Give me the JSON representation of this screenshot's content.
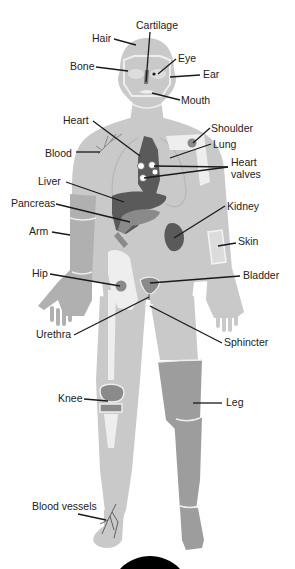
{
  "diagram": {
    "type": "anatomy-labeled-figure",
    "colors": {
      "body_light": "#c9c9c9",
      "body_mid": "#b0b0b0",
      "organ_dark": "#5a5a5a",
      "organ_mid": "#8a8a8a",
      "bone": "#eeeeee",
      "leg_dark": "#9d9d9d",
      "label_text": "#222222",
      "leader_line": "#1a1a1a",
      "bottom_shape": "#000000"
    },
    "labels": [
      {
        "id": "cartilage",
        "text": "Cartilage",
        "x": 136,
        "y": 29
      },
      {
        "id": "hair",
        "text": "Hair",
        "x": 92,
        "y": 42
      },
      {
        "id": "eye",
        "text": "Eye",
        "x": 178,
        "y": 62
      },
      {
        "id": "bone",
        "text": "Bone",
        "x": 70,
        "y": 70
      },
      {
        "id": "ear",
        "text": "Ear",
        "x": 203,
        "y": 78
      },
      {
        "id": "mouth",
        "text": "Mouth",
        "x": 181,
        "y": 104
      },
      {
        "id": "heart",
        "text": "Heart",
        "x": 63,
        "y": 124
      },
      {
        "id": "shoulder",
        "text": "Shoulder",
        "x": 211,
        "y": 132
      },
      {
        "id": "lung",
        "text": "Lung",
        "x": 213,
        "y": 148
      },
      {
        "id": "blood",
        "text": "Blood",
        "x": 45,
        "y": 157
      },
      {
        "id": "heart-valves-1",
        "text": "Heart",
        "x": 231,
        "y": 166
      },
      {
        "id": "heart-valves-2",
        "text": "valves",
        "x": 231,
        "y": 178
      },
      {
        "id": "liver",
        "text": "Liver",
        "x": 38,
        "y": 185
      },
      {
        "id": "pancreas",
        "text": "Pancreas",
        "x": 11,
        "y": 207
      },
      {
        "id": "kidney",
        "text": "Kidney",
        "x": 227,
        "y": 210
      },
      {
        "id": "arm",
        "text": "Arm",
        "x": 29,
        "y": 235
      },
      {
        "id": "skin",
        "text": "Skin",
        "x": 238,
        "y": 245
      },
      {
        "id": "hip",
        "text": "Hip",
        "x": 32,
        "y": 277
      },
      {
        "id": "bladder",
        "text": "Bladder",
        "x": 243,
        "y": 279
      },
      {
        "id": "urethra",
        "text": "Urethra",
        "x": 36,
        "y": 338
      },
      {
        "id": "sphincter",
        "text": "Sphincter",
        "x": 224,
        "y": 346
      },
      {
        "id": "knee",
        "text": "Knee",
        "x": 58,
        "y": 402
      },
      {
        "id": "leg",
        "text": "Leg",
        "x": 226,
        "y": 406
      },
      {
        "id": "blood-vessels",
        "text": "Blood vessels",
        "x": 32,
        "y": 510
      }
    ]
  }
}
